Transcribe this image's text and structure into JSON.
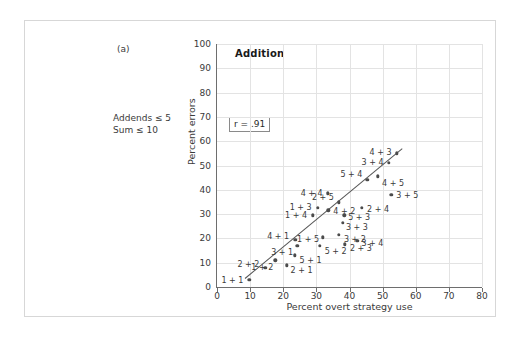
{
  "figure": {
    "part_label": "(a)",
    "note_line1": "Addends ≤ 5",
    "note_line2": "Sum ≤ 10"
  },
  "chart_data": {
    "type": "scatter",
    "title": "Addition",
    "xlabel": "Percent overt strategy use",
    "ylabel": "Percent errors",
    "xlim": [
      0,
      80
    ],
    "ylim": [
      0,
      100
    ],
    "xticks": [
      0,
      10,
      20,
      30,
      40,
      50,
      60,
      70,
      80
    ],
    "yticks": [
      0,
      10,
      20,
      30,
      40,
      50,
      60,
      70,
      80,
      90,
      100
    ],
    "grid": true,
    "annotation": "r = .91",
    "correlation": 0.91,
    "fit_line": {
      "x0": 8.5,
      "y0": 3.5,
      "x1": 56.0,
      "y1": 57.0
    },
    "point_label_key": "problem",
    "points": [
      {
        "problem": "1 + 1",
        "x": 9.8,
        "y": 3.0,
        "label_dx": -17,
        "label_dy": 0
      },
      {
        "problem": "2 + 2",
        "x": 14.6,
        "y": 8.0,
        "label_dx": -17,
        "label_dy": -4
      },
      {
        "problem": "1 + 2",
        "x": 17.6,
        "y": 11.0,
        "label_dx": -13,
        "label_dy": 7
      },
      {
        "problem": "2 + 1",
        "x": 21.0,
        "y": 9.0,
        "label_dx": 15,
        "label_dy": 5
      },
      {
        "problem": "5 + 1",
        "x": 23.4,
        "y": 13.0,
        "label_dx": 16,
        "label_dy": 5
      },
      {
        "problem": "3 + 1",
        "x": 24.2,
        "y": 17.0,
        "label_dx": -15,
        "label_dy": 6
      },
      {
        "problem": "4 + 1",
        "x": 23.6,
        "y": 19.5,
        "label_dx": -17,
        "label_dy": -4
      },
      {
        "problem": "1 + 5",
        "x": 32.0,
        "y": 20.5,
        "label_dx": -15,
        "label_dy": 2
      },
      {
        "problem": "5 + 2",
        "x": 31.0,
        "y": 17.0,
        "label_dx": 16,
        "label_dy": 5
      },
      {
        "problem": "2 + 3",
        "x": 38.6,
        "y": 17.5,
        "label_dx": 16,
        "label_dy": 4
      },
      {
        "problem": "3 + 2",
        "x": 36.8,
        "y": 21.5,
        "label_dx": 16,
        "label_dy": 4
      },
      {
        "problem": "3 + 4",
        "x": 42.4,
        "y": 19.0,
        "label_dx": 15,
        "label_dy": 2
      },
      {
        "problem": "1 + 4",
        "x": 29.0,
        "y": 29.5,
        "label_dx": -17,
        "label_dy": 0
      },
      {
        "problem": "1 + 3",
        "x": 30.4,
        "y": 32.5,
        "label_dx": -17,
        "label_dy": -1
      },
      {
        "problem": "4 + 2",
        "x": 33.6,
        "y": 31.5,
        "label_dx": 16,
        "label_dy": 1
      },
      {
        "problem": "4 + 4",
        "x": 33.4,
        "y": 38.5,
        "label_dx": -16,
        "label_dy": 0
      },
      {
        "problem": "2 + 5",
        "x": 36.8,
        "y": 34.8,
        "label_dx": -16,
        "label_dy": -5
      },
      {
        "problem": "3 + 3",
        "x": 38.0,
        "y": 26.5,
        "label_dx": 14,
        "label_dy": 4
      },
      {
        "problem": "5 + 3",
        "x": 38.4,
        "y": 29.5,
        "label_dx": 15,
        "label_dy": 2
      },
      {
        "problem": "2 + 4",
        "x": 43.8,
        "y": 32.5,
        "label_dx": 16,
        "label_dy": 1
      },
      {
        "problem": "5 + 4",
        "x": 45.4,
        "y": 44.0,
        "label_dx": -16,
        "label_dy": -6
      },
      {
        "problem": "4 + 5",
        "x": 48.6,
        "y": 45.5,
        "label_dx": 15,
        "label_dy": 7
      },
      {
        "problem": "3 + 5",
        "x": 52.6,
        "y": 38.0,
        "label_dx": 16,
        "label_dy": 0
      },
      {
        "problem": "3 + 4 ",
        "x": 51.8,
        "y": 51.0,
        "label_dx": -16,
        "label_dy": -1
      },
      {
        "problem": "4 + 3",
        "x": 54.2,
        "y": 55.0,
        "label_dx": -16,
        "label_dy": -1
      }
    ]
  }
}
